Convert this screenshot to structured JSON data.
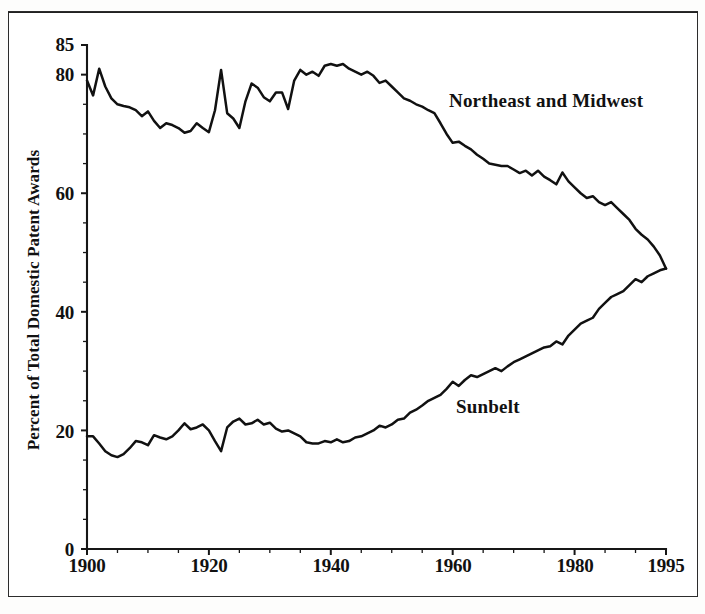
{
  "chart_data": {
    "type": "line",
    "title": "",
    "subtitle": "",
    "xlabel": "",
    "ylabel": "Percent of Total Domestic Patent Awards",
    "xlim": [
      1900,
      1995
    ],
    "ylim": [
      0,
      85
    ],
    "grid": false,
    "legend_position": "inline-annotation",
    "x_ticks": [
      "1900",
      "1920",
      "1940",
      "1960",
      "1980",
      "1995"
    ],
    "x_tick_values": [
      1900,
      1920,
      1940,
      1960,
      1980,
      1995
    ],
    "y_ticks": [
      "0",
      "20",
      "40",
      "60",
      "80",
      "85"
    ],
    "y_tick_values": [
      0,
      20,
      40,
      60,
      80,
      85
    ],
    "minor_tick_interval_x": 5,
    "minor_tick_interval_y": 5,
    "annotations": [
      {
        "text": "Northeast and Midwest",
        "x": 1958,
        "y": 72
      },
      {
        "text": "Sunbelt",
        "x": 1959,
        "y": 28
      }
    ],
    "x": [
      1900,
      1901,
      1902,
      1903,
      1904,
      1905,
      1906,
      1907,
      1908,
      1909,
      1910,
      1911,
      1912,
      1913,
      1914,
      1915,
      1916,
      1917,
      1918,
      1919,
      1920,
      1921,
      1922,
      1923,
      1924,
      1925,
      1926,
      1927,
      1928,
      1929,
      1930,
      1931,
      1932,
      1933,
      1934,
      1935,
      1936,
      1937,
      1938,
      1939,
      1940,
      1941,
      1942,
      1943,
      1944,
      1945,
      1946,
      1947,
      1948,
      1949,
      1950,
      1951,
      1952,
      1953,
      1954,
      1955,
      1956,
      1957,
      1958,
      1959,
      1960,
      1961,
      1962,
      1963,
      1964,
      1965,
      1966,
      1967,
      1968,
      1969,
      1970,
      1971,
      1972,
      1973,
      1974,
      1975,
      1976,
      1977,
      1978,
      1979,
      1980,
      1981,
      1982,
      1983,
      1984,
      1985,
      1986,
      1987,
      1988,
      1989,
      1990,
      1991,
      1992,
      1993,
      1994,
      1995
    ],
    "series": [
      {
        "name": "Northeast and Midwest",
        "color": "#111111",
        "values": [
          79.0,
          76.5,
          81.0,
          78.0,
          76.0,
          75.0,
          74.7,
          74.5,
          74.0,
          73.0,
          73.8,
          72.2,
          71.0,
          71.8,
          71.5,
          71.0,
          70.2,
          70.5,
          71.8,
          71.0,
          70.3,
          74.0,
          80.8,
          73.5,
          72.6,
          71.0,
          75.5,
          78.5,
          77.8,
          76.2,
          75.5,
          77.0,
          77.0,
          74.2,
          79.0,
          80.8,
          80.0,
          80.5,
          79.8,
          81.5,
          81.8,
          81.5,
          81.8,
          81.0,
          80.5,
          80.0,
          80.5,
          79.8,
          78.6,
          79.0,
          78.0,
          77.0,
          76.0,
          75.6,
          75.0,
          74.6,
          74.0,
          73.5,
          71.8,
          70.0,
          68.5,
          68.7,
          68.0,
          67.4,
          66.5,
          65.8,
          65.0,
          64.8,
          64.6,
          64.6,
          64.0,
          63.4,
          63.8,
          63.0,
          63.8,
          62.8,
          62.2,
          61.5,
          63.5,
          62.0,
          61.0,
          60.0,
          59.2,
          59.5,
          58.5,
          58.0,
          58.5,
          57.5,
          56.5,
          55.5,
          54.0,
          53.0,
          52.2,
          51.0,
          49.5,
          47.3
        ]
      },
      {
        "name": "Sunbelt",
        "color": "#111111",
        "values": [
          19.0,
          19.0,
          17.8,
          16.5,
          15.8,
          15.5,
          16.0,
          17.0,
          18.2,
          18.0,
          17.5,
          19.2,
          18.8,
          18.5,
          19.0,
          20.0,
          21.2,
          20.2,
          20.5,
          21.0,
          20.0,
          18.2,
          16.5,
          20.5,
          21.5,
          22.0,
          21.0,
          21.2,
          21.8,
          21.0,
          21.3,
          20.3,
          19.8,
          20.0,
          19.5,
          19.0,
          18.0,
          17.8,
          17.8,
          18.2,
          18.0,
          18.5,
          18.0,
          18.2,
          18.8,
          19.0,
          19.5,
          20.0,
          20.8,
          20.5,
          21.0,
          21.8,
          22.0,
          23.0,
          23.5,
          24.2,
          25.0,
          25.5,
          26.0,
          27.0,
          28.2,
          27.5,
          28.5,
          29.3,
          29.0,
          29.5,
          30.0,
          30.5,
          30.0,
          30.8,
          31.5,
          32.0,
          32.5,
          33.0,
          33.5,
          34.0,
          34.2,
          35.0,
          34.5,
          36.0,
          37.0,
          38.0,
          38.5,
          39.0,
          40.5,
          41.5,
          42.5,
          43.0,
          43.5,
          44.5,
          45.5,
          45.0,
          46.0,
          46.5,
          47.0,
          47.3
        ]
      }
    ]
  },
  "axes": {
    "y_title": "Percent of Total Domestic Patent Awards"
  },
  "labels": {
    "northeast": "Northeast and Midwest",
    "sunbelt": "Sunbelt"
  },
  "ticks": {
    "y": [
      "85",
      "80",
      "60",
      "40",
      "20",
      "0"
    ],
    "x": [
      "1900",
      "1920",
      "1940",
      "1960",
      "1980",
      "1995"
    ]
  }
}
